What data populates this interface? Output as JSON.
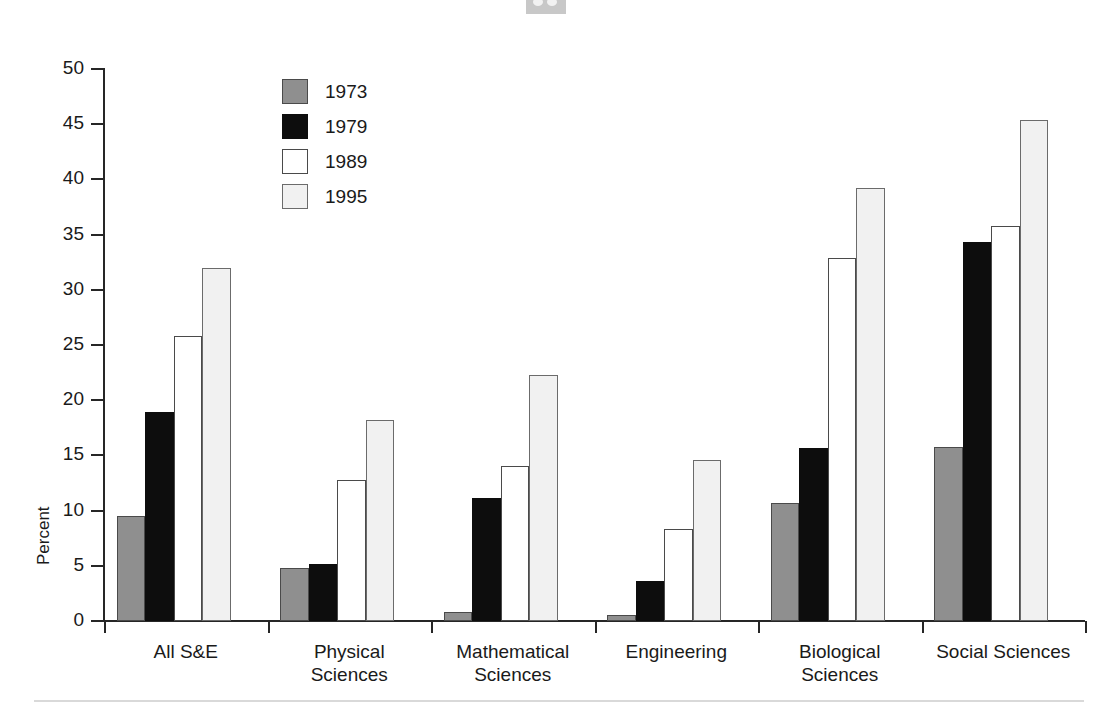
{
  "chart_data": {
    "type": "bar",
    "title": "",
    "subtitle": "",
    "xlabel": "",
    "ylabel": "Percent",
    "ylim": [
      0,
      50
    ],
    "ytick_step": 5,
    "yticks": [
      0,
      5,
      10,
      15,
      20,
      25,
      30,
      35,
      40,
      45,
      50
    ],
    "ytick_labels": [
      "0",
      "5",
      "10",
      "15",
      "20",
      "25",
      "30",
      "35",
      "40",
      "45",
      "50"
    ],
    "grid": false,
    "legend_position": "upper-left-inside",
    "categories": [
      "All S&E",
      "Physical\nSciences",
      "Mathematical\nSciences",
      "Engineering",
      "Biological\nSciences",
      "Social Sciences"
    ],
    "series": [
      {
        "name": "1973",
        "color": "#8f8f8f",
        "values": [
          9.5,
          4.8,
          0.8,
          0.5,
          10.7,
          15.8
        ]
      },
      {
        "name": "1979",
        "color": "#0d0d0d",
        "values": [
          18.9,
          5.2,
          11.1,
          3.6,
          15.7,
          34.3
        ]
      },
      {
        "name": "1989",
        "color": "#ffffff",
        "values": [
          25.8,
          12.8,
          14.0,
          8.3,
          32.9,
          35.8
        ]
      },
      {
        "name": "1995",
        "color": "#f1f1f1",
        "values": [
          32.0,
          18.2,
          22.3,
          14.6,
          39.2,
          45.4
        ]
      }
    ]
  },
  "legend": {
    "items": [
      {
        "label": "1973",
        "swatch": "s1973"
      },
      {
        "label": "1979",
        "swatch": "s1979"
      },
      {
        "label": "1989",
        "swatch": "s1989"
      },
      {
        "label": "1995",
        "swatch": "s1995"
      }
    ]
  },
  "colors": {
    "axis": "#262626",
    "text": "#1a1a1a",
    "background": "#ffffff",
    "rule": "#d9d9d9",
    "artifact": "#c8c8c8"
  }
}
